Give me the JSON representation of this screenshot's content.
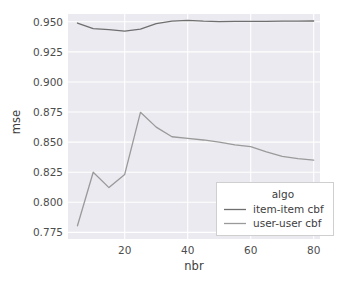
{
  "chart_data": {
    "type": "line",
    "title": "",
    "xlabel": "nbr",
    "ylabel": "mse",
    "xlim": [
      2,
      82
    ],
    "ylim": [
      0.7695,
      0.9565
    ],
    "xticks": [
      20,
      40,
      60,
      80
    ],
    "xtick_labels": [
      "20",
      "40",
      "60",
      "80"
    ],
    "yticks": [
      0.775,
      0.8,
      0.825,
      0.85,
      0.875,
      0.9,
      0.925,
      0.95
    ],
    "ytick_labels": [
      "0.775",
      "0.800",
      "0.825",
      "0.850",
      "0.875",
      "0.900",
      "0.925",
      "0.950"
    ],
    "grid": true,
    "grid_color": "#ffffff",
    "plot_bg": "#eaeaf0",
    "figure_bg": "#ffffff",
    "legend": {
      "title": "algo",
      "position": "lower right",
      "entries": [
        {
          "label": "item-item cbf",
          "color": "#6f6f6f"
        },
        {
          "label": "user-user cbf",
          "color": "#9a9a9a"
        }
      ]
    },
    "series": [
      {
        "name": "item-item cbf",
        "color": "#6f6f6f",
        "x": [
          5,
          10,
          15,
          20,
          25,
          30,
          35,
          40,
          45,
          50,
          55,
          60,
          65,
          70,
          75,
          80
        ],
        "y": [
          0.949,
          0.9443,
          0.9435,
          0.9422,
          0.944,
          0.9485,
          0.9505,
          0.9512,
          0.9505,
          0.9502,
          0.9503,
          0.9503,
          0.9504,
          0.9505,
          0.9506,
          0.9507
        ]
      },
      {
        "name": "user-user cbf",
        "color": "#9a9a9a",
        "x": [
          5,
          10,
          15,
          20,
          25,
          30,
          35,
          40,
          45,
          50,
          55,
          60,
          65,
          70,
          75,
          80
        ],
        "y": [
          0.7805,
          0.825,
          0.8122,
          0.8232,
          0.8748,
          0.8625,
          0.8545,
          0.8532,
          0.8518,
          0.85,
          0.8478,
          0.8462,
          0.842,
          0.8382,
          0.8363,
          0.835
        ]
      }
    ]
  }
}
